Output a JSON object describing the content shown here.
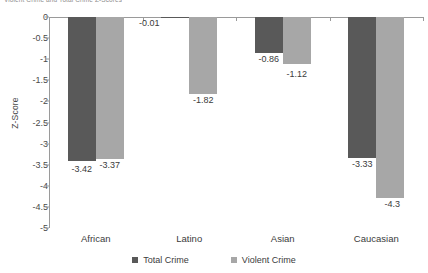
{
  "top_caption": "Violent Crime and Total Crime Z-Scores",
  "legend": {
    "position": "bottom-center",
    "items": [
      {
        "label": "Total Crime",
        "color": "#595959",
        "icon": "square-swatch"
      },
      {
        "label": "Violent Crime",
        "color": "#a7a7a7",
        "icon": "square-swatch"
      }
    ]
  },
  "axes": {
    "ylabel": "Z-Score",
    "xlabel": "",
    "yticks": [
      "0",
      "-0.5",
      "-1",
      "-1.5",
      "-2",
      "-2.5",
      "-3",
      "-3.5",
      "-4",
      "-4.5",
      "-5"
    ],
    "ytick_values": [
      0,
      -0.5,
      -1,
      -1.5,
      -2,
      -2.5,
      -3,
      -3.5,
      -4,
      -4.5,
      -5
    ]
  },
  "chart_data": {
    "type": "bar",
    "title": "",
    "xlabel": "",
    "ylabel": "Z-Score",
    "ylim": [
      -5,
      0
    ],
    "grid": false,
    "legend_position": "bottom-center",
    "categories": [
      "African",
      "Latino",
      "Asian",
      "Caucasian"
    ],
    "series": [
      {
        "name": "Total Crime",
        "color": "#595959",
        "values": [
          -3.42,
          -0.01,
          -0.86,
          -3.33
        ],
        "labels": [
          "-3.42",
          "-0.01",
          "-0.86",
          "-3.33"
        ]
      },
      {
        "name": "Violent Crime",
        "color": "#a7a7a7",
        "values": [
          -3.37,
          -1.82,
          -1.12,
          -4.3
        ],
        "labels": [
          "-3.37",
          "-1.82",
          "-1.12",
          "-4.3"
        ]
      }
    ]
  }
}
